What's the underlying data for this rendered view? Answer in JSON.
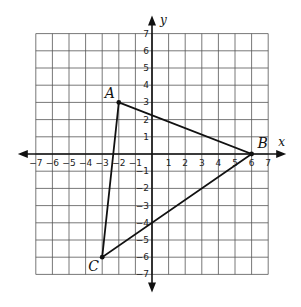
{
  "axes": {
    "x_label": "x",
    "y_label": "y",
    "x_range": [
      -7,
      7
    ],
    "y_range": [
      -7,
      7
    ],
    "x_ticks": [
      "-7",
      "-6",
      "-5",
      "-4",
      "-3",
      "-2",
      "-1",
      "1",
      "2",
      "3",
      "4",
      "5",
      "6",
      "7"
    ],
    "y_ticks": [
      "7",
      "6",
      "5",
      "4",
      "3",
      "2",
      "1",
      "-1",
      "-2",
      "-3",
      "-4",
      "-5",
      "-6",
      "-7"
    ]
  },
  "triangle": {
    "vertices": [
      {
        "name": "A",
        "x": -2,
        "y": 3
      },
      {
        "name": "B",
        "x": 6,
        "y": 0
      },
      {
        "name": "C",
        "x": -3,
        "y": -6
      }
    ]
  },
  "colors": {
    "grid": "#555555",
    "axis": "#111111",
    "line": "#111111"
  }
}
